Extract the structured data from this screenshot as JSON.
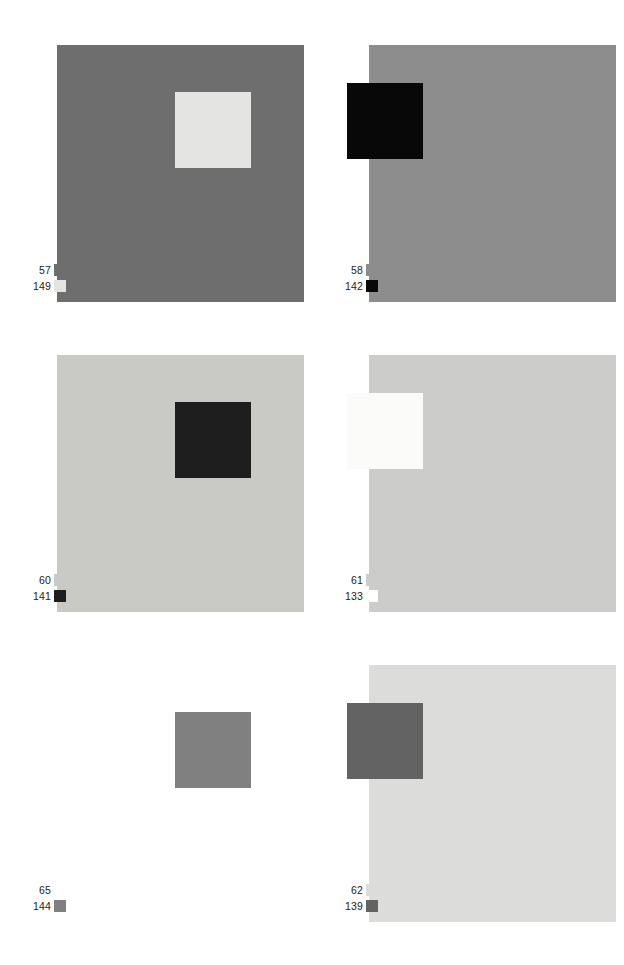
{
  "figure": {
    "background_color": "#ffffff",
    "columns": 2,
    "rows": 3,
    "plate_count": 6
  },
  "legend_key": {
    "first_row_meaning": "surround field value",
    "second_row_meaning": "inset patch value"
  },
  "plates": [
    {
      "id": "plate-1",
      "position": "row-1 col-left",
      "field": {
        "label": "57",
        "color": "#6e6e6e",
        "swatch_color": "#6e6e6e",
        "visible": true
      },
      "patch": {
        "label": "149",
        "color": "#e4e4e2",
        "swatch_color": "#e4e4e2",
        "visible": true,
        "side": "right"
      }
    },
    {
      "id": "plate-2",
      "position": "row-1 col-right",
      "field": {
        "label": "58",
        "color": "#8d8d8d",
        "swatch_color": "#8d8d8d",
        "visible": true
      },
      "patch": {
        "label": "142",
        "color": "#080808",
        "swatch_color": "#080808",
        "visible": true,
        "side": "left"
      }
    },
    {
      "id": "plate-3",
      "position": "row-2 col-left",
      "field": {
        "label": "60",
        "color": "#c9c9c5",
        "swatch_color": "#c9c9c5",
        "visible": true
      },
      "patch": {
        "label": "141",
        "color": "#1e1e1e",
        "swatch_color": "#1e1e1e",
        "visible": true,
        "side": "right"
      }
    },
    {
      "id": "plate-4",
      "position": "row-2 col-right",
      "field": {
        "label": "61",
        "color": "#cccccb",
        "swatch_color": "#cccccb",
        "visible": true
      },
      "patch": {
        "label": "133",
        "color": "#fbfbf9",
        "swatch_color": "#ffffff",
        "visible": true,
        "side": "left"
      }
    },
    {
      "id": "plate-5",
      "position": "row-3 col-left",
      "field": {
        "label": "65",
        "color": "#ffffff",
        "swatch_color": "#ffffff",
        "visible": false
      },
      "patch": {
        "label": "144",
        "color": "#808080",
        "swatch_color": "#808080",
        "visible": true,
        "side": "right"
      }
    },
    {
      "id": "plate-6",
      "position": "row-3 col-right",
      "field": {
        "label": "62",
        "color": "#dcdcda",
        "swatch_color": "#dcdcda",
        "visible": true
      },
      "patch": {
        "label": "139",
        "color": "#636363",
        "swatch_color": "#636363",
        "visible": true,
        "side": "left"
      }
    }
  ]
}
